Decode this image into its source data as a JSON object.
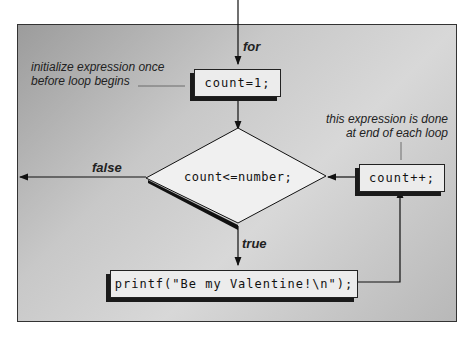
{
  "diagram": {
    "type": "flowchart",
    "entry_label": "for",
    "init_box": "count=1;",
    "init_note": [
      "initialize expression once",
      "before loop begins"
    ],
    "condition": "count<=number;",
    "false_label": "false",
    "true_label": "true",
    "body_box": "printf(\"Be my Valentine!\\n\");",
    "increment_box": "count++;",
    "increment_note": [
      "this expression is done",
      "at end of each loop"
    ]
  }
}
